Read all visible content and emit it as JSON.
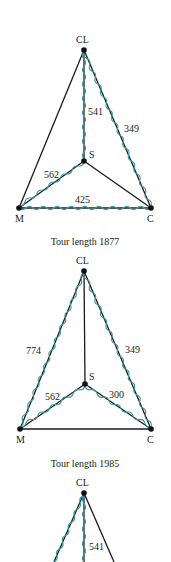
{
  "figures": [
    {
      "nodes": {
        "CL": [
          84,
          50
        ],
        "S": [
          84,
          161
        ],
        "M": [
          19,
          208
        ],
        "C": [
          151,
          208
        ]
      },
      "node_labels": {
        "CL": "CL",
        "S": "S",
        "M": "M",
        "C": "C"
      },
      "edge_labels": {
        "CL_S": "541",
        "CL_C": "349",
        "M_S": "562",
        "M_C": "425"
      },
      "caption": "Tour length 1877"
    },
    {
      "nodes": {
        "CL": [
          84,
          271
        ],
        "S": [
          85,
          384
        ],
        "M": [
          20,
          429
        ],
        "C": [
          151,
          429
        ]
      },
      "node_labels": {
        "CL": "CL",
        "S": "S",
        "M": "M",
        "C": "C"
      },
      "edge_labels": {
        "CL_M": "774",
        "CL_C": "349",
        "M_S": "562",
        "S_C": "300"
      },
      "caption": "Tour length 1985"
    },
    {
      "nodes": {
        "CL": [
          84,
          493
        ]
      },
      "node_labels": {
        "CL": "CL"
      },
      "edge_labels": {
        "CL_S": "541"
      }
    }
  ],
  "colors": {
    "edge": "#1a1a1a",
    "tour": "#3a9aa5"
  }
}
